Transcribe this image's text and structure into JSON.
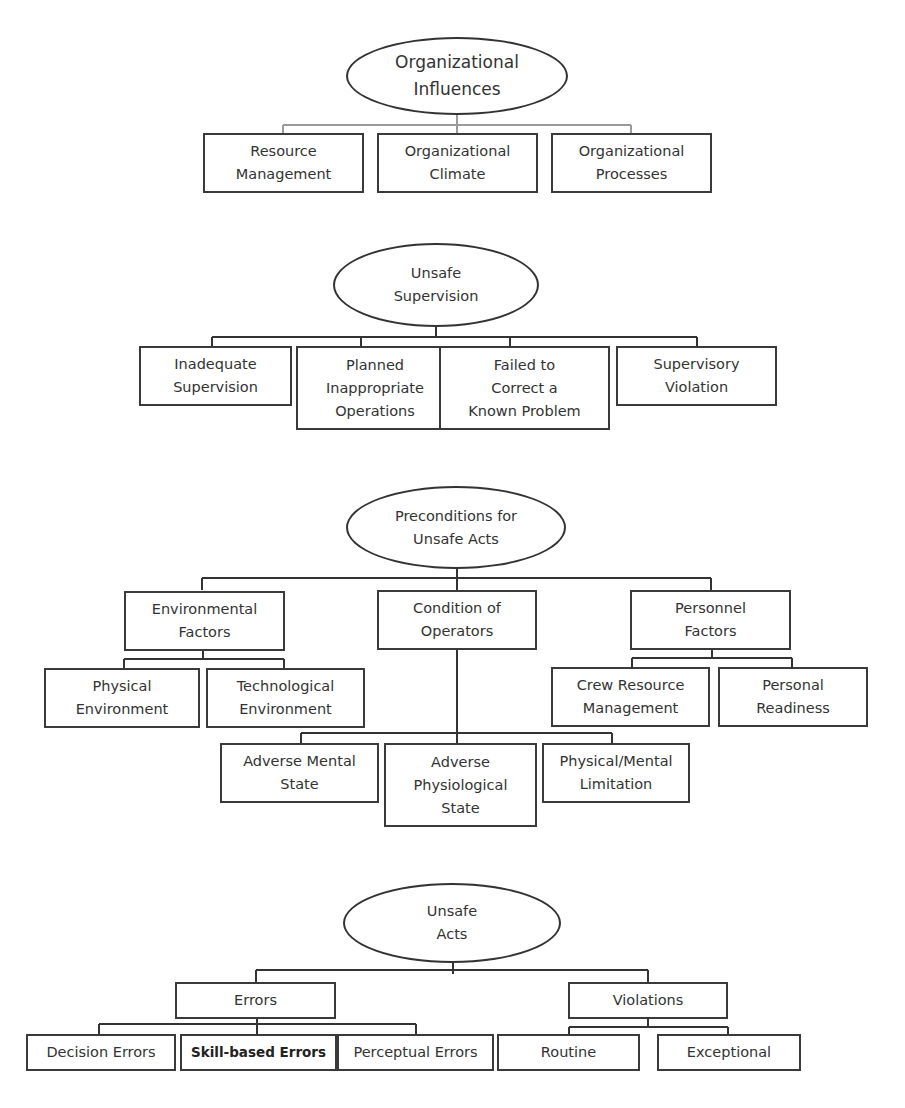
{
  "diagram": {
    "type": "hierarchy",
    "levels": [
      {
        "title": "Organizational\nInfluences",
        "children": [
          {
            "label": "Resource\nManagement"
          },
          {
            "label": "Organizational\nClimate"
          },
          {
            "label": "Organizational\nProcesses"
          }
        ]
      },
      {
        "title": "Unsafe\nSupervision",
        "children": [
          {
            "label": "Inadequate\nSupervision"
          },
          {
            "label": "Planned\nInappropriate\nOperations"
          },
          {
            "label": "Failed to\nCorrect a\nKnown Problem"
          },
          {
            "label": "Supervisory\nViolation"
          }
        ]
      },
      {
        "title": "Preconditions for\nUnsafe Acts",
        "children": [
          {
            "label": "Environmental\nFactors",
            "children": [
              {
                "label": "Physical\nEnvironment"
              },
              {
                "label": "Technological\nEnvironment"
              }
            ]
          },
          {
            "label": "Condition of\nOperators",
            "children": [
              {
                "label": "Adverse Mental\nState"
              },
              {
                "label": "Adverse\nPhysiological\nState"
              },
              {
                "label": "Physical/Mental\nLimitation"
              }
            ]
          },
          {
            "label": "Personnel\nFactors",
            "children": [
              {
                "label": "Crew Resource\nManagement"
              },
              {
                "label": "Personal\nReadiness"
              }
            ]
          }
        ]
      },
      {
        "title": "Unsafe\nActs",
        "children": [
          {
            "label": "Errors",
            "children": [
              {
                "label": "Decision Errors"
              },
              {
                "label": "Skill-based Errors"
              },
              {
                "label": "Perceptual Errors"
              }
            ]
          },
          {
            "label": "Violations",
            "children": [
              {
                "label": "Routine"
              },
              {
                "label": "Exceptional"
              }
            ]
          }
        ]
      }
    ]
  }
}
